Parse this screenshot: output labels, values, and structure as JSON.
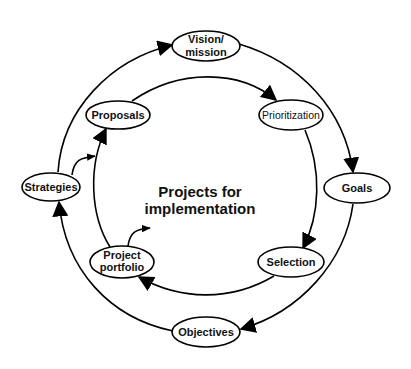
{
  "diagram": {
    "type": "cycle",
    "center_label": {
      "line1": "Projects for",
      "line2": "implementation"
    },
    "outer_cycle": {
      "nodes": [
        {
          "id": "vision",
          "label_line1": "Vision/",
          "label_line2": "mission"
        },
        {
          "id": "goals",
          "label": "Goals"
        },
        {
          "id": "objectives",
          "label": "Objectives"
        },
        {
          "id": "strategies",
          "label": "Strategies"
        }
      ],
      "edges": [
        {
          "from": "vision",
          "to": "goals"
        },
        {
          "from": "goals",
          "to": "objectives"
        },
        {
          "from": "objectives",
          "to": "strategies"
        },
        {
          "from": "strategies",
          "to": "vision"
        }
      ]
    },
    "inner_cycle": {
      "nodes": [
        {
          "id": "proposals",
          "label": "Proposals"
        },
        {
          "id": "prioritization",
          "label": "Prioritization"
        },
        {
          "id": "selection",
          "label": "Selection"
        },
        {
          "id": "portfolio",
          "label_line1": "Project",
          "label_line2": "portfolio"
        }
      ],
      "edges": [
        {
          "from": "proposals",
          "to": "prioritization"
        },
        {
          "from": "prioritization",
          "to": "selection"
        },
        {
          "from": "selection",
          "to": "portfolio"
        },
        {
          "from": "portfolio",
          "to": "proposals"
        }
      ]
    },
    "cross_edges": [
      {
        "from": "strategies",
        "to": "proposals"
      },
      {
        "from": "portfolio",
        "to": "projects-for-implementation"
      }
    ],
    "colors": {
      "stroke": "#000000",
      "fill": "#ffffff",
      "text": "#111111"
    }
  }
}
